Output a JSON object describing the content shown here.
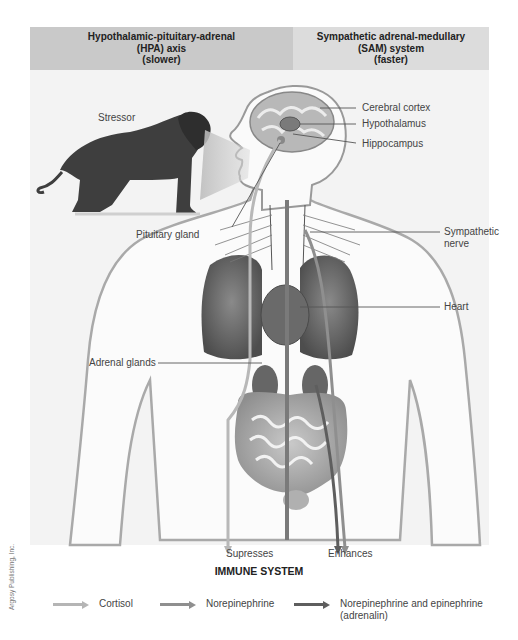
{
  "header": {
    "left": {
      "line1": "Hypothalamic-pituitary-adrenal",
      "line2": "(HPA) axis",
      "line3": "(slower)"
    },
    "right": {
      "line1": "Sympathetic adrenal-medullary",
      "line2": "(SAM) system",
      "line3": "(faster)"
    }
  },
  "labels": {
    "stressor": "Stressor",
    "cerebral_cortex": "Cerebral cortex",
    "hypothalamus": "Hypothalamus",
    "hippocampus": "Hippocampus",
    "pituitary_gland": "Pituitary gland",
    "sympathetic_nerve_1": "Sympathetic",
    "sympathetic_nerve_2": "nerve",
    "heart": "Heart",
    "adrenal_glands": "Adrenal glands",
    "supresses": "Supresses",
    "enhances": "Enhances"
  },
  "immune_system": "IMMUNE SYSTEM",
  "legend": [
    {
      "label": "Cortisol",
      "color": "#b5b5b5"
    },
    {
      "label": "Norepinephrine",
      "color": "#8f8f8f"
    },
    {
      "label_line1": "Norepinephrine and epinephrine",
      "label_line2": "(adrenalin)",
      "color": "#5e5e5e"
    }
  ],
  "credit": "Argosy Publishing, Inc."
}
